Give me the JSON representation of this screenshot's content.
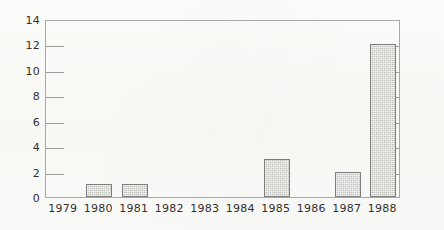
{
  "chart_data": {
    "type": "bar",
    "title": "",
    "subtitle": "",
    "xlabel": "",
    "ylabel": "",
    "categories": [
      "1979",
      "1980",
      "1981",
      "1982",
      "1983",
      "1984",
      "1985",
      "1986",
      "1987",
      "1988"
    ],
    "values": [
      0,
      1,
      1,
      0,
      0,
      0,
      3,
      0,
      2,
      12
    ],
    "series": [
      {
        "name": "",
        "values": [
          0,
          1,
          1,
          0,
          0,
          0,
          3,
          0,
          2,
          12
        ]
      }
    ],
    "ylim": [
      0,
      14
    ],
    "ytick_values": [
      0,
      2,
      4,
      6,
      8,
      10,
      12,
      14
    ],
    "ytick_labels": [
      "0",
      "2",
      "4",
      "6",
      "8",
      "10",
      "12",
      "14"
    ],
    "xtick_labels": [
      "1979",
      "1980",
      "1981",
      "1982",
      "1983",
      "1984",
      "1985",
      "1986",
      "1987",
      "1988"
    ],
    "grid": false,
    "legend": null,
    "legend_position": "none",
    "annotations": [],
    "axis_style": {
      "box": true,
      "left_ticks_labeled": true,
      "right_ticks_labeled": false,
      "tick_direction": "inward"
    },
    "bar_fill_color": "#c9c9c4",
    "bar_edge_color": "#7d7d7d",
    "axis_color": "#a9a9a9",
    "text_color": "#33302f",
    "background_color": "#fdfdfb"
  }
}
